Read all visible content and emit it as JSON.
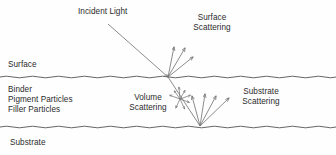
{
  "figure": {
    "background_color": "#fefefe",
    "text_color": "#2b2b2b",
    "line_color": "#6f6f6f",
    "boundary_color": "#555555",
    "width": 336,
    "height": 155
  },
  "labels": {
    "incident_light": "Incident Light",
    "surface_scattering_line1": "Surface",
    "surface_scattering_line2": "Scattering",
    "surface": "Surface",
    "binder": "Binder",
    "pigment_particles": "Pigment Particles",
    "filler_particles": "Filler Particles",
    "volume_scattering_line1": "Volume",
    "volume_scattering_line2": "Scattering",
    "substrate_scattering_line1": "Substrate",
    "substrate_scattering_line2": "Scattering",
    "substrate": "Substrate"
  },
  "layers": [
    {
      "name": "Surface",
      "top_y": 0,
      "bottom_y": 77
    },
    {
      "name": "Coating",
      "top_y": 77,
      "bottom_y": 127
    },
    {
      "name": "Substrate",
      "top_y": 127,
      "bottom_y": 155
    }
  ],
  "boundaries": {
    "surface_y": 77,
    "substrate_y": 127,
    "wave_amplitude": 1.6,
    "wave_period": 26
  },
  "rays": {
    "incident": {
      "x1": 108,
      "y1": 24,
      "x2": 168,
      "y2": 77
    },
    "surface_hit": {
      "x": 168,
      "y": 77
    },
    "surface_scatter": [
      {
        "x1": 168,
        "y1": 77,
        "x2": 174,
        "y2": 47
      },
      {
        "x1": 168,
        "y1": 77,
        "x2": 185,
        "y2": 48
      },
      {
        "x1": 168,
        "y1": 77,
        "x2": 193,
        "y2": 57
      }
    ],
    "refracted": {
      "x1": 168,
      "y1": 77,
      "x2": 200,
      "y2": 126
    },
    "volume_center": {
      "x": 180,
      "y": 99
    },
    "volume_scatter": [
      {
        "angle_deg": 200,
        "length": 11
      },
      {
        "angle_deg": 235,
        "length": 10
      },
      {
        "angle_deg": 265,
        "length": 12
      },
      {
        "angle_deg": 300,
        "length": 10
      },
      {
        "angle_deg": 340,
        "length": 11
      },
      {
        "angle_deg": 20,
        "length": 10
      },
      {
        "angle_deg": 65,
        "length": 11
      },
      {
        "angle_deg": 115,
        "length": 10
      }
    ],
    "substrate_hit": {
      "x": 200,
      "y": 126
    },
    "substrate_scatter": [
      {
        "x1": 200,
        "y1": 126,
        "x2": 192,
        "y2": 96
      },
      {
        "x1": 200,
        "y1": 126,
        "x2": 205,
        "y2": 94
      },
      {
        "x1": 200,
        "y1": 126,
        "x2": 216,
        "y2": 96
      },
      {
        "x1": 200,
        "y1": 126,
        "x2": 229,
        "y2": 98
      }
    ]
  }
}
